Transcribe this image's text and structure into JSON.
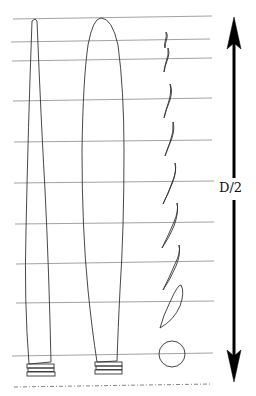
{
  "diagram": {
    "type": "propeller-blade-planform-and-sections",
    "label": "D/2",
    "colors": {
      "line": "#333333",
      "station_line": "#8a8a8a",
      "arrow": "#000000",
      "background": "#ffffff"
    },
    "stations_y": [
      19,
      42,
      61,
      101,
      142,
      183,
      224,
      263,
      303,
      355
    ],
    "axis_dashed_y": 386,
    "blades": [
      {
        "name": "narrow-blade",
        "description": "slender planform"
      },
      {
        "name": "wide-blade",
        "description": "wide planform"
      }
    ],
    "sections": {
      "count": 10,
      "root_shape": "circle"
    },
    "arrow": {
      "direction": "both",
      "x": 234,
      "y_top": 18,
      "y_bottom": 380
    }
  }
}
